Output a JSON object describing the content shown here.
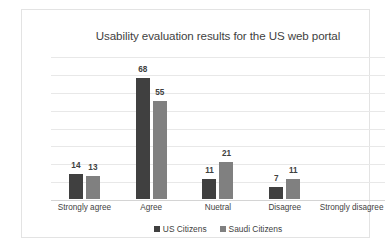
{
  "chart_data": {
    "type": "bar",
    "title": "Usability evaluation results for the US web portal",
    "xlabel": "",
    "ylabel": "",
    "ylim": [
      0,
      80
    ],
    "grid": true,
    "gridlines": [
      0,
      10,
      20,
      30,
      40,
      50,
      60,
      70,
      80
    ],
    "legend_position": "bottom",
    "categories": [
      "Strongly agree",
      "Agree",
      "Nuetral",
      "Disagree",
      "Strongly disagree"
    ],
    "series": [
      {
        "name": "US Citizens",
        "color": "#404040",
        "values": [
          14,
          68,
          11,
          7,
          0
        ],
        "labels": [
          "14",
          "68",
          "11",
          "7",
          ""
        ]
      },
      {
        "name": "Saudi Citizens",
        "color": "#808080",
        "values": [
          13,
          55,
          21,
          11,
          0
        ],
        "labels": [
          "13",
          "55",
          "21",
          "11",
          ""
        ]
      }
    ]
  },
  "colors": {
    "series_us": "#404040",
    "series_saudi": "#808080",
    "gridline": "#e8e8e8",
    "baseline": "#d4d4d4",
    "frame": "#e3e3e3",
    "text": "#3f3f3f",
    "background": "#ffffff"
  }
}
